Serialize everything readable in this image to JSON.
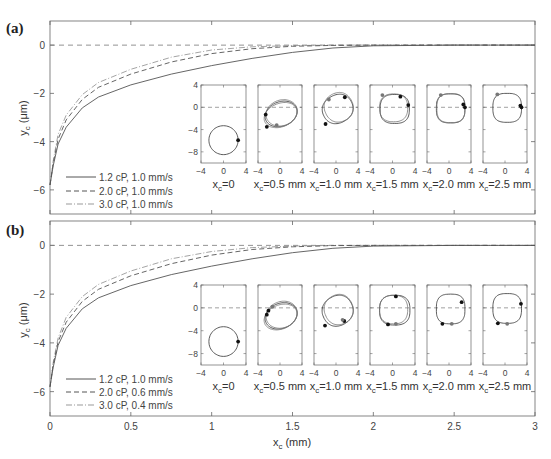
{
  "chart_data": [
    {
      "panel": "(a)",
      "type": "line",
      "xlabel": "",
      "ylabel": "y_c (μm)",
      "xlim": [
        0,
        3
      ],
      "ylim": [
        -7,
        1
      ],
      "xticks": [
        0,
        0.5,
        1,
        1.5,
        2,
        2.5,
        3
      ],
      "yticks": [
        0,
        -2,
        -4,
        -6
      ],
      "ytick_labels": [
        "0",
        "−2",
        "−4",
        "−6"
      ],
      "reference_line": {
        "y": 0,
        "style": "dashed"
      },
      "legend": {
        "position": "lower left"
      },
      "series": [
        {
          "name": "1.2 cP, 1.0 mm/s",
          "style": "solid",
          "x": [
            0,
            0.02,
            0.05,
            0.1,
            0.2,
            0.3,
            0.5,
            0.75,
            1.0,
            1.25,
            1.5,
            1.75,
            2.0,
            2.5,
            3.0
          ],
          "y": [
            -5.8,
            -5.0,
            -4.1,
            -3.4,
            -2.6,
            -2.15,
            -1.65,
            -1.2,
            -0.85,
            -0.55,
            -0.3,
            -0.12,
            -0.03,
            0,
            0
          ]
        },
        {
          "name": "2.0 cP, 1.0 mm/s",
          "style": "dashed",
          "x": [
            0,
            0.02,
            0.05,
            0.1,
            0.2,
            0.3,
            0.5,
            0.75,
            1.0,
            1.25,
            1.5,
            1.75,
            2.0,
            2.5,
            3.0
          ],
          "y": [
            -5.8,
            -4.9,
            -3.9,
            -3.1,
            -2.25,
            -1.75,
            -1.2,
            -0.7,
            -0.35,
            -0.15,
            -0.05,
            -0.01,
            0,
            0,
            0
          ]
        },
        {
          "name": "3.0 cP, 1.0 mm/s",
          "style": "dashdot",
          "x": [
            0,
            0.02,
            0.05,
            0.1,
            0.2,
            0.3,
            0.5,
            0.75,
            1.0,
            1.25,
            1.5,
            1.75,
            2.0,
            2.5,
            3.0
          ],
          "y": [
            -5.8,
            -4.8,
            -3.7,
            -2.9,
            -2.05,
            -1.55,
            -1.0,
            -0.5,
            -0.2,
            -0.07,
            -0.02,
            0,
            0,
            0,
            0
          ]
        }
      ],
      "insets": {
        "xlim": [
          -4,
          4
        ],
        "ylim": [
          -10,
          4
        ],
        "xticks": [
          -4,
          0,
          4
        ],
        "yticks": [
          4,
          0,
          -4,
          -8
        ],
        "ytick_labels": [
          "4",
          "0",
          "−4",
          "−8"
        ],
        "xtick_labels": [
          "−4",
          "0",
          "4"
        ],
        "labels": [
          "x_c=0",
          "x_c=0.5 mm",
          "x_c=1.0 mm",
          "x_c=1.5 mm",
          "x_c=2.0 mm",
          "x_c=2.5 mm"
        ]
      }
    },
    {
      "panel": "(b)",
      "type": "line",
      "xlabel": "x_c (mm)",
      "ylabel": "y_c (μm)",
      "xlim": [
        0,
        3
      ],
      "ylim": [
        -7,
        1
      ],
      "xticks": [
        0,
        0.5,
        1,
        1.5,
        2,
        2.5,
        3
      ],
      "xtick_labels": [
        "0",
        "0.5",
        "1",
        "1.5",
        "2",
        "2.5",
        "3"
      ],
      "yticks": [
        0,
        -2,
        -4,
        -6
      ],
      "ytick_labels": [
        "0",
        "−2",
        "−4",
        "−6"
      ],
      "reference_line": {
        "y": 0,
        "style": "dashed"
      },
      "legend": {
        "position": "lower left"
      },
      "series": [
        {
          "name": "1.2 cP, 1.0 mm/s",
          "style": "solid",
          "x": [
            0,
            0.02,
            0.05,
            0.1,
            0.2,
            0.3,
            0.5,
            0.75,
            1.0,
            1.25,
            1.5,
            1.75,
            2.0,
            2.5,
            3.0
          ],
          "y": [
            -5.8,
            -5.0,
            -4.1,
            -3.4,
            -2.6,
            -2.15,
            -1.65,
            -1.2,
            -0.85,
            -0.55,
            -0.3,
            -0.12,
            -0.03,
            0,
            0
          ]
        },
        {
          "name": "2.0 cP, 0.6 mm/s",
          "style": "dashed",
          "x": [
            0,
            0.02,
            0.05,
            0.1,
            0.2,
            0.3,
            0.5,
            0.75,
            1.0,
            1.25,
            1.5,
            1.75,
            2.0,
            2.5,
            3.0
          ],
          "y": [
            -5.8,
            -4.9,
            -3.95,
            -3.15,
            -2.3,
            -1.8,
            -1.25,
            -0.75,
            -0.4,
            -0.17,
            -0.06,
            -0.01,
            0,
            0,
            0
          ]
        },
        {
          "name": "3.0 cP, 0.4 mm/s",
          "style": "dashdot",
          "x": [
            0,
            0.02,
            0.05,
            0.1,
            0.2,
            0.3,
            0.5,
            0.75,
            1.0,
            1.25,
            1.5,
            1.75,
            2.0,
            2.5,
            3.0
          ],
          "y": [
            -5.8,
            -4.8,
            -3.8,
            -2.95,
            -2.1,
            -1.6,
            -1.05,
            -0.55,
            -0.25,
            -0.09,
            -0.03,
            0,
            0,
            0,
            0
          ]
        }
      ],
      "insets": {
        "xlim": [
          -4,
          4
        ],
        "ylim": [
          -10,
          4
        ],
        "xticks": [
          -4,
          0,
          4
        ],
        "yticks": [
          4,
          0,
          -4,
          -8
        ],
        "ytick_labels": [
          "4",
          "0",
          "−4",
          "−8"
        ],
        "xtick_labels": [
          "−4",
          "0",
          "4"
        ],
        "labels": [
          "x_c=0",
          "x_c=0.5 mm",
          "x_c=1.0 mm",
          "x_c=1.5 mm",
          "x_c=2.0 mm",
          "x_c=2.5 mm"
        ]
      }
    }
  ],
  "figure": {
    "panels": [
      {
        "label": "(a)",
        "legend": [
          "1.2 cP, 1.0 mm/s",
          "2.0 cP, 1.0 mm/s",
          "3.0 cP, 1.0 mm/s"
        ]
      },
      {
        "label": "(b)",
        "legend": [
          "1.2 cP, 1.0 mm/s",
          "2.0 cP, 0.6 mm/s",
          "3.0 cP, 0.4 mm/s"
        ]
      }
    ],
    "ylabel_main": "y",
    "ylabel_sub": "c",
    "ylabel_unit": " (μm)",
    "xlabel_main": "x",
    "xlabel_sub": "c",
    "xlabel_unit": " (mm)",
    "inset_labels": [
      {
        "main": "x",
        "sub": "c",
        "rest": "=0"
      },
      {
        "main": "x",
        "sub": "c",
        "rest": "=0.5 mm"
      },
      {
        "main": "x",
        "sub": "c",
        "rest": "=1.0 mm"
      },
      {
        "main": "x",
        "sub": "c",
        "rest": "=1.5 mm"
      },
      {
        "main": "x",
        "sub": "c",
        "rest": "=2.0 mm"
      },
      {
        "main": "x",
        "sub": "c",
        "rest": "=2.5 mm"
      }
    ],
    "colors": {
      "axis": "#666666",
      "line": "#444444",
      "line_light": "#888888",
      "dot": "#111111",
      "dot_light": "#777777"
    }
  }
}
